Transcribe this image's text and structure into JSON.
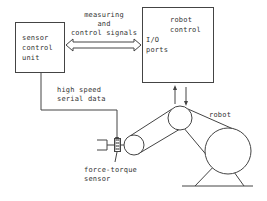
{
  "diagram": {
    "sensor_control_unit": {
      "lines": [
        "sensor",
        "control",
        "unit"
      ]
    },
    "robot_control": {
      "lines": [
        "robot",
        "control"
      ],
      "ports_lines": [
        "I/O",
        "ports"
      ]
    },
    "link_signals": {
      "lines": [
        "measuring",
        "and",
        "control signals"
      ]
    },
    "link_serial": {
      "lines": [
        "high speed",
        "serial data"
      ]
    },
    "force_torque_sensor": {
      "lines": [
        "force-torque",
        "sensor"
      ]
    },
    "robot": {
      "label": "robot"
    }
  }
}
